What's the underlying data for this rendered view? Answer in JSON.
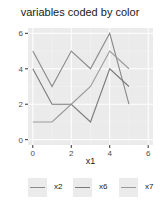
{
  "chart_data": {
    "type": "line",
    "title": "variables coded by color",
    "xlabel": "x1",
    "ylabel": "",
    "x": [
      0,
      1,
      2,
      3,
      4,
      5
    ],
    "series": [
      {
        "name": "x2",
        "values": [
          5,
          3,
          5,
          4,
          6,
          2
        ],
        "color": "#8a8a8a"
      },
      {
        "name": "x6",
        "values": [
          4,
          2,
          2,
          1,
          4,
          3
        ],
        "color": "#7a7a7a"
      },
      {
        "name": "x7",
        "values": [
          1,
          1,
          2,
          3,
          5,
          4
        ],
        "color": "#9a9a9a"
      }
    ],
    "xlim": [
      -0.25,
      6.25
    ],
    "ylim": [
      -0.3,
      6.3
    ],
    "x_ticks": [
      0,
      2,
      4,
      6
    ],
    "y_ticks": [
      0,
      2,
      4,
      6
    ],
    "grid": true,
    "legend_position": "bottom",
    "panel_background": "#ebebeb"
  },
  "legend": {
    "items": [
      {
        "label": "x2",
        "color": "#8a8a8a"
      },
      {
        "label": "x6",
        "color": "#7a7a7a"
      },
      {
        "label": "x7",
        "color": "#9a9a9a"
      }
    ]
  }
}
